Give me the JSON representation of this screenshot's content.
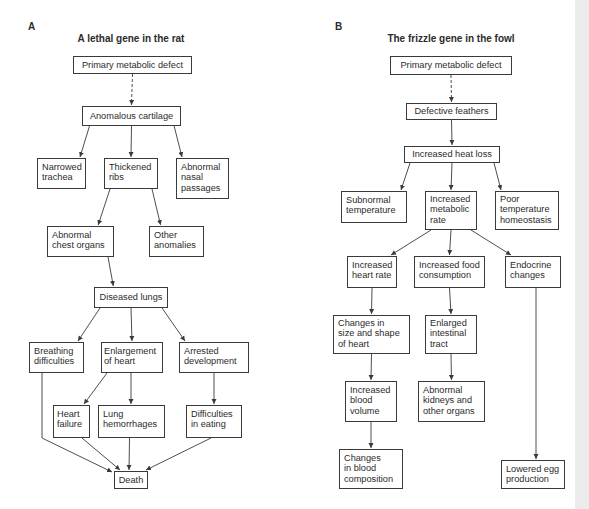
{
  "panels": [
    {
      "label": "A",
      "title": "A lethal gene in the rat",
      "nodes": [
        {
          "id": "a_primary",
          "text": "Primary metabolic defect"
        },
        {
          "id": "a_cartilage",
          "text": "Anomalous cartilage"
        },
        {
          "id": "a_trachea",
          "text": "Narrowed\ntrachea"
        },
        {
          "id": "a_ribs",
          "text": "Thickened\nribs"
        },
        {
          "id": "a_nasal",
          "text": "Abnormal\nnasal\npassages"
        },
        {
          "id": "a_chest",
          "text": "Abnormal\nchest organs"
        },
        {
          "id": "a_other",
          "text": "Other\nanomalies"
        },
        {
          "id": "a_lungs",
          "text": "Diseased lungs"
        },
        {
          "id": "a_breathing",
          "text": "Breathing\ndifficulties"
        },
        {
          "id": "a_enlarge",
          "text": "Enlargement\nof heart"
        },
        {
          "id": "a_arrested",
          "text": "Arrested\ndevelopment"
        },
        {
          "id": "a_failure",
          "text": "Heart\nfailure"
        },
        {
          "id": "a_hemorrhage",
          "text": "Lung\nhemorrhages"
        },
        {
          "id": "a_eating",
          "text": "Difficulties\nin eating"
        },
        {
          "id": "a_death",
          "text": "Death"
        }
      ],
      "edges": [
        {
          "from": "a_primary",
          "to": "a_cartilage",
          "style": "dashed"
        },
        {
          "from": "a_cartilage",
          "to": "a_trachea"
        },
        {
          "from": "a_cartilage",
          "to": "a_ribs"
        },
        {
          "from": "a_cartilage",
          "to": "a_nasal"
        },
        {
          "from": "a_ribs",
          "to": "a_chest"
        },
        {
          "from": "a_ribs",
          "to": "a_other"
        },
        {
          "from": "a_chest",
          "to": "a_lungs"
        },
        {
          "from": "a_lungs",
          "to": "a_breathing"
        },
        {
          "from": "a_lungs",
          "to": "a_enlarge"
        },
        {
          "from": "a_lungs",
          "to": "a_arrested"
        },
        {
          "from": "a_enlarge",
          "to": "a_failure"
        },
        {
          "from": "a_enlarge",
          "to": "a_hemorrhage"
        },
        {
          "from": "a_arrested",
          "to": "a_eating"
        },
        {
          "from": "a_breathing",
          "to": "a_death"
        },
        {
          "from": "a_failure",
          "to": "a_death"
        },
        {
          "from": "a_hemorrhage",
          "to": "a_death"
        },
        {
          "from": "a_eating",
          "to": "a_death"
        }
      ]
    },
    {
      "label": "B",
      "title": "The frizzle gene in the fowl",
      "nodes": [
        {
          "id": "b_primary",
          "text": "Primary metabolic defect"
        },
        {
          "id": "b_feathers",
          "text": "Defective feathers"
        },
        {
          "id": "b_heatloss",
          "text": "Increased heat loss"
        },
        {
          "id": "b_subnormal",
          "text": "Subnormal\ntemperature"
        },
        {
          "id": "b_metabolic",
          "text": "Increased\nmetabolic\nrate"
        },
        {
          "id": "b_homeostasis",
          "text": "Poor\ntemperature\nhomeostasis"
        },
        {
          "id": "b_heartrate",
          "text": "Increased\nheart rate"
        },
        {
          "id": "b_food",
          "text": "Increased food\nconsumption"
        },
        {
          "id": "b_endocrine",
          "text": "Endocrine\nchanges"
        },
        {
          "id": "b_heartshape",
          "text": "Changes in\nsize and shape\nof heart"
        },
        {
          "id": "b_intestinal",
          "text": "Enlarged\nintestinal\ntract"
        },
        {
          "id": "b_bloodvol",
          "text": "Increased\nblood\nvolume"
        },
        {
          "id": "b_kidneys",
          "text": "Abnormal\nkidneys and\nother organs"
        },
        {
          "id": "b_bloodcomp",
          "text": "Changes\nin blood\ncomposition"
        },
        {
          "id": "b_egg",
          "text": "Lowered egg\nproduction"
        }
      ],
      "edges": [
        {
          "from": "b_primary",
          "to": "b_feathers",
          "style": "dashed"
        },
        {
          "from": "b_feathers",
          "to": "b_heatloss"
        },
        {
          "from": "b_heatloss",
          "to": "b_subnormal"
        },
        {
          "from": "b_heatloss",
          "to": "b_metabolic"
        },
        {
          "from": "b_heatloss",
          "to": "b_homeostasis"
        },
        {
          "from": "b_metabolic",
          "to": "b_heartrate"
        },
        {
          "from": "b_metabolic",
          "to": "b_food"
        },
        {
          "from": "b_metabolic",
          "to": "b_endocrine"
        },
        {
          "from": "b_heartrate",
          "to": "b_heartshape"
        },
        {
          "from": "b_food",
          "to": "b_intestinal"
        },
        {
          "from": "b_heartshape",
          "to": "b_bloodvol"
        },
        {
          "from": "b_intestinal",
          "to": "b_kidneys"
        },
        {
          "from": "b_bloodvol",
          "to": "b_bloodcomp"
        },
        {
          "from": "b_endocrine",
          "to": "b_egg"
        }
      ]
    }
  ],
  "colors": {
    "line": "#3a3a3a",
    "text": "#2b2b2b",
    "page_edge": "#ececec"
  }
}
